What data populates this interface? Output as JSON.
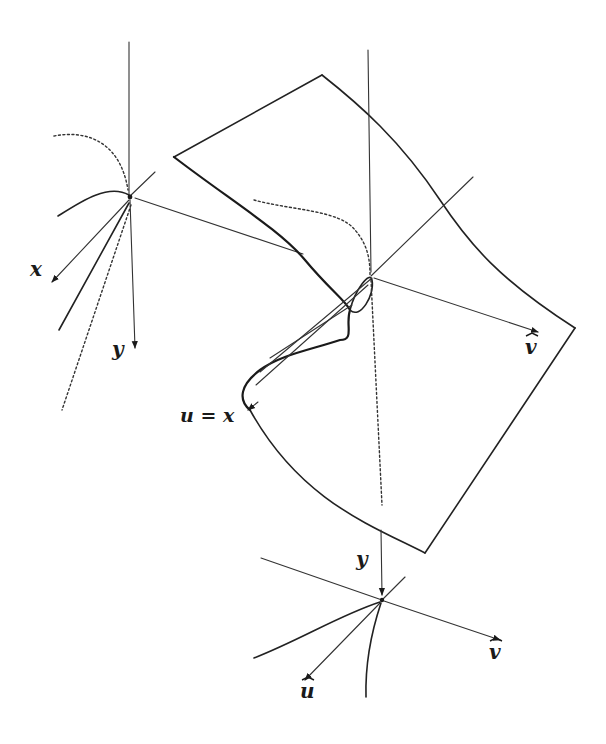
{
  "figure": {
    "labels": {
      "left_frame_x": "x",
      "left_frame_y": "y",
      "surface_v": "v",
      "surface_u_eq_x": "u = x",
      "bottom_frame_y": "y",
      "bottom_frame_v": "v",
      "bottom_frame_u": "u"
    },
    "colors": {
      "ink": "#1a1a1a",
      "background": "#ffffff"
    }
  }
}
